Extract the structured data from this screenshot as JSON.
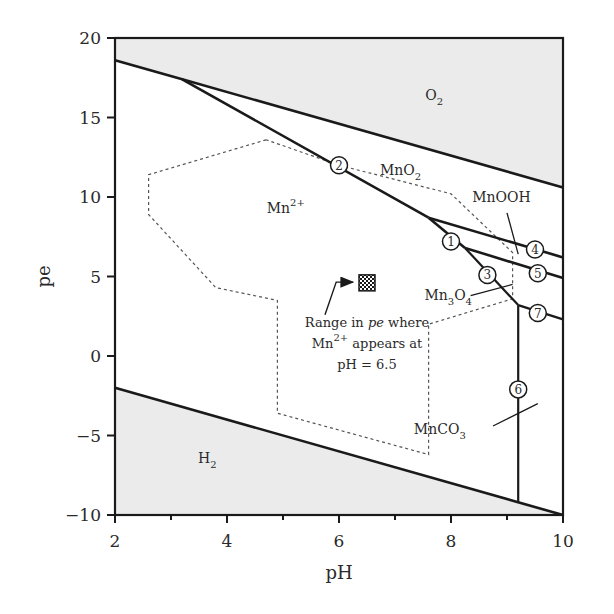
{
  "chart_data": {
    "type": "diagram",
    "xlabel": "pH",
    "ylabel": "pe",
    "xlim": [
      2,
      10
    ],
    "ylim": [
      -10,
      20
    ],
    "x_ticks_major": [
      2,
      4,
      6,
      8,
      10
    ],
    "x_ticks_minor": [
      3,
      5,
      7,
      9
    ],
    "y_ticks": [
      20,
      15,
      10,
      5,
      0,
      -5,
      -10
    ],
    "grid": false,
    "colors": {
      "axis": "#1a1a1a",
      "line": "#1a1a1a",
      "shade": "#ebebeb",
      "dashed": "#555555",
      "text": "#2a2a2a"
    },
    "shaded_regions": [
      {
        "name": "O2",
        "polygon": [
          [
            2,
            20
          ],
          [
            10,
            20
          ],
          [
            10,
            10.6
          ],
          [
            3.2,
            17.4
          ],
          [
            2,
            18.6
          ]
        ]
      },
      {
        "name": "H2",
        "polygon": [
          [
            2,
            -2
          ],
          [
            10,
            -10
          ],
          [
            2,
            -10
          ]
        ]
      }
    ],
    "boundary_lines": [
      {
        "id": "O2-H2O",
        "points": [
          [
            2,
            18.6
          ],
          [
            3.2,
            17.4
          ],
          [
            10,
            10.6
          ]
        ]
      },
      {
        "id": "H2O-H2",
        "points": [
          [
            2,
            -2
          ],
          [
            10,
            -10
          ]
        ]
      },
      {
        "id": "line-2",
        "points": [
          [
            3.2,
            17.4
          ],
          [
            7.6,
            8.7
          ]
        ]
      },
      {
        "id": "line-1",
        "points": [
          [
            7.6,
            8.7
          ],
          [
            8.25,
            6.8
          ]
        ]
      },
      {
        "id": "line-3",
        "points": [
          [
            8.25,
            6.8
          ],
          [
            9.2,
            3.2
          ]
        ]
      },
      {
        "id": "line-4",
        "points": [
          [
            7.6,
            8.7
          ],
          [
            10,
            6.2
          ]
        ]
      },
      {
        "id": "line-5",
        "points": [
          [
            8.25,
            6.8
          ],
          [
            10,
            4.9
          ]
        ]
      },
      {
        "id": "line-7",
        "points": [
          [
            9.2,
            3.2
          ],
          [
            10,
            2.3
          ]
        ]
      },
      {
        "id": "line-6",
        "points": [
          [
            9.2,
            3.2
          ],
          [
            9.2,
            -9.2
          ]
        ]
      }
    ],
    "dashed_boundary": {
      "name": "Range of natural water conditions",
      "points": [
        [
          4.7,
          13.6
        ],
        [
          2.6,
          11.4
        ],
        [
          2.6,
          8.9
        ],
        [
          3.8,
          4.3
        ],
        [
          4.9,
          3.5
        ],
        [
          4.9,
          -3.6
        ],
        [
          7.6,
          -6.2
        ],
        [
          7.6,
          2.0
        ],
        [
          9.1,
          3.6
        ],
        [
          9.1,
          6.5
        ],
        [
          8.0,
          10.2
        ],
        [
          6.0,
          12.0
        ],
        [
          4.7,
          13.6
        ]
      ]
    },
    "circled_markers": [
      {
        "label": "1",
        "x": 8.0,
        "y": 7.2
      },
      {
        "label": "2",
        "x": 6.0,
        "y": 12.0
      },
      {
        "label": "3",
        "x": 8.65,
        "y": 5.1
      },
      {
        "label": "4",
        "x": 9.5,
        "y": 6.7
      },
      {
        "label": "5",
        "x": 9.55,
        "y": 5.2
      },
      {
        "label": "6",
        "x": 9.2,
        "y": -2.1
      },
      {
        "label": "7",
        "x": 9.55,
        "y": 2.7
      }
    ],
    "region_labels": [
      {
        "text": "O",
        "sub": "2",
        "x": 7.7,
        "y": 16.1
      },
      {
        "text": "MnO",
        "sub": "2",
        "x": 7.1,
        "y": 11.4
      },
      {
        "text": "Mn",
        "sup": "2+",
        "x": 5.05,
        "y": 9.0
      },
      {
        "text": "MnOOH",
        "x": 8.9,
        "y": 9.7
      },
      {
        "text": "Mn",
        "sub": "3",
        "text2": "O",
        "sub2": "4",
        "x": 7.95,
        "y": 3.5
      },
      {
        "text": "MnCO",
        "sub": "3",
        "x": 7.8,
        "y": -4.9
      },
      {
        "text": "H",
        "sub": "2",
        "x": 3.65,
        "y": -6.7
      }
    ],
    "leader_lines": [
      {
        "for": "MnOOH",
        "points": [
          [
            9.0,
            9.0
          ],
          [
            9.2,
            6.4
          ]
        ]
      },
      {
        "for": "Mn3O4",
        "points": [
          [
            8.35,
            3.8
          ],
          [
            9.1,
            4.5
          ]
        ]
      },
      {
        "for": "MnCO3",
        "points": [
          [
            8.75,
            -4.4
          ],
          [
            9.55,
            -3.0
          ]
        ]
      }
    ],
    "annotation": {
      "lines": [
        "Range in pe where",
        "Mn2+ appears at",
        "pH = 6.5"
      ],
      "line1": "Range in ",
      "line1_italic": "pe",
      "line1_end": " where",
      "line2_a": "Mn",
      "line2_sup": "2+",
      "line2_b": " appears at",
      "line3": "pH = 6.5",
      "x": 6.5,
      "y": 1.8,
      "marker": {
        "x": 6.5,
        "y": 4.6,
        "pe_range_description": "checkered marker at pH 6.5"
      },
      "arrow": {
        "from": [
          5.75,
          2.6
        ],
        "to": [
          6.25,
          4.65
        ],
        "bend": [
          5.95,
          4.65
        ]
      }
    }
  }
}
